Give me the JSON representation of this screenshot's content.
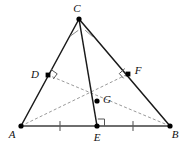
{
  "figure": {
    "type": "geometry-diagram",
    "width": 187,
    "height": 144,
    "background_color": "#ffffff"
  },
  "colors": {
    "solid_edge": "#1a1a1a",
    "base_edge": "#6e6e6e",
    "dashed_cevian": "#9a9a9a",
    "right_angle": "#555555",
    "tick": "#5a5a5a",
    "label": "#111111",
    "dot": "#000000"
  },
  "points": [
    {
      "name": "A",
      "label": "A",
      "x": 21,
      "y": 126,
      "label_x": 12,
      "label_y": 138,
      "role": "triangle-vertex"
    },
    {
      "name": "B",
      "label": "B",
      "x": 170,
      "y": 126,
      "label_x": 173,
      "label_y": 138,
      "role": "triangle-vertex"
    },
    {
      "name": "C",
      "label": "C",
      "x": 79,
      "y": 19,
      "label_x": 75,
      "label_y": 12,
      "role": "triangle-apex"
    },
    {
      "name": "D",
      "label": "D",
      "x": 48,
      "y": 75,
      "label_x": 33,
      "label_y": 74,
      "role": "foot-on-AC"
    },
    {
      "name": "F",
      "label": "F",
      "x": 128,
      "y": 74,
      "label_x": 136,
      "label_y": 72,
      "role": "foot-on-BC"
    },
    {
      "name": "G",
      "label": "G",
      "x": 97,
      "y": 101,
      "label_x": 103,
      "label_y": 100,
      "role": "intersection-point"
    },
    {
      "name": "E",
      "label": "E",
      "x": 97,
      "y": 126,
      "label_x": 93,
      "label_y": 140,
      "role": "foot-on-AB"
    }
  ],
  "segments": [
    {
      "name": "side-AC",
      "from": "A",
      "to": "C",
      "style": "solid",
      "x1": 21,
      "y1": 126,
      "x2": 79,
      "y2": 19
    },
    {
      "name": "side-BC",
      "from": "C",
      "to": "B",
      "style": "solid",
      "x1": 79,
      "y1": 19,
      "x2": 170,
      "y2": 126
    },
    {
      "name": "side-AB",
      "from": "A",
      "to": "B",
      "style": "base",
      "x1": 21,
      "y1": 126,
      "x2": 170,
      "y2": 126
    },
    {
      "name": "cevian-CE",
      "from": "C",
      "to": "E",
      "style": "solid",
      "x1": 79,
      "y1": 19,
      "x2": 97,
      "y2": 126
    },
    {
      "name": "cevian-AF",
      "from": "A",
      "to": "F",
      "style": "dashed",
      "x1": 21,
      "y1": 126,
      "x2": 128,
      "y2": 74
    },
    {
      "name": "cevian-BD",
      "from": "B",
      "to": "D",
      "style": "dashed",
      "x1": 170,
      "y1": 126,
      "x2": 48,
      "y2": 75
    }
  ],
  "right_angle_marks": [
    {
      "name": "right-angle-at-D",
      "at": "D",
      "x": 48,
      "y": 75
    },
    {
      "name": "right-angle-at-F",
      "at": "F",
      "x": 128,
      "y": 74
    },
    {
      "name": "right-angle-at-E",
      "at": "E",
      "x": 97,
      "y": 126
    }
  ],
  "congruence_ticks": [
    {
      "name": "tick-on-AE",
      "segment": "A-E",
      "x": 60,
      "y": 126
    },
    {
      "name": "tick-on-EB",
      "segment": "E-B",
      "x": 133,
      "y": 126
    }
  ],
  "angle_ticks": [
    {
      "name": "angle-tick-DCE",
      "at": "C",
      "side": "left",
      "x": 74,
      "y": 33
    },
    {
      "name": "angle-tick-ECF",
      "at": "C",
      "side": "right",
      "x": 88,
      "y": 34
    }
  ],
  "caption": ""
}
